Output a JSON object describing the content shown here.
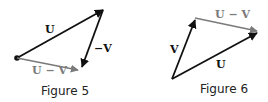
{
  "figures": [
    {
      "caption": "Figure 5",
      "labels": {
        "u": "U",
        "neg_v": "−V",
        "u_minus_v": "U − V"
      }
    },
    {
      "caption": "Figure 6",
      "labels": {
        "v": "V",
        "u_minus_v": "U − V",
        "u": "U"
      }
    }
  ],
  "colors": {
    "black_vector": "#111111",
    "gray_vector": "#7a7a7a"
  }
}
